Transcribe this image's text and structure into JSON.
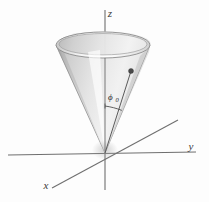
{
  "figure": {
    "background_color": "#fdfdfd",
    "axis_color": "#6b6b6b",
    "line_color": "#555555",
    "cone_outline_color": "#8a8a8a",
    "cone_light_color": "#ffffff",
    "cone_mid_color": "#d9d9d9",
    "cone_dark_color": "#9e9e9e",
    "rim_top_color": "#f2f2f2",
    "point_color": "#4a4a4a"
  },
  "axes": {
    "z": {
      "label": "z",
      "start": {
        "x": 105,
        "y": 190
      },
      "end": {
        "x": 105,
        "y": 10
      }
    },
    "y": {
      "label": "y",
      "start": {
        "x": 8,
        "y": 155
      },
      "end": {
        "x": 196,
        "y": 152
      }
    },
    "x": {
      "label": "x",
      "start": {
        "x": 178,
        "y": 120
      },
      "end": {
        "x": 52,
        "y": 188
      }
    },
    "origin": {
      "x": 105,
      "y": 153
    }
  },
  "axis_labels": {
    "z": {
      "text": "z",
      "x": 110,
      "y": 16
    },
    "y": {
      "text": "y",
      "x": 190,
      "y": 150
    },
    "x": {
      "text": "x",
      "x": 45,
      "y": 188
    }
  },
  "cone": {
    "apex": {
      "x": 105,
      "y": 153
    },
    "rim_center": {
      "x": 103,
      "y": 45
    },
    "rim_rx": 47,
    "rim_ry": 13,
    "opening_half_angle_deg": 24
  },
  "point": {
    "name": "surface-point",
    "x": 131,
    "y": 71,
    "radius": 2.4
  },
  "radial_line": {
    "from": {
      "x": 105,
      "y": 153
    },
    "to": {
      "x": 131,
      "y": 71
    }
  },
  "angle_marker": {
    "label": "ϕ",
    "subscript": "0",
    "label_x": 108,
    "label_y": 99,
    "sub_x": 116,
    "sub_y": 101,
    "arc_radius": 47,
    "tick_from": {
      "x": 105,
      "y": 106
    },
    "tick_to": {
      "x": 122,
      "y": 110
    }
  }
}
